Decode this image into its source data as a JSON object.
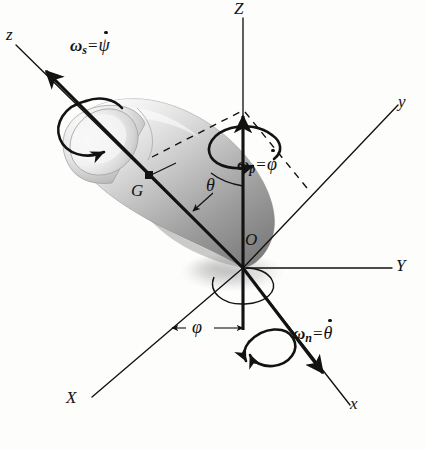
{
  "figure": {
    "background_color": "#fdfdfc",
    "ink_color": "#121212",
    "body_color": "#b8b8b8"
  },
  "axes": [
    {
      "name": "Z-axis",
      "label": "Z",
      "style": "solid",
      "from": [
        243,
        268
      ],
      "to": [
        243,
        18
      ],
      "label_pos": [
        237,
        2
      ],
      "arrow": false
    },
    {
      "name": "y-axis",
      "label": "y",
      "style": "solid",
      "from": [
        243,
        268
      ],
      "to": [
        398,
        105
      ],
      "label_pos": [
        399,
        95
      ],
      "arrow": false
    },
    {
      "name": "Y-axis",
      "label": "Y",
      "style": "solid",
      "from": [
        243,
        268
      ],
      "to": [
        392,
        268
      ],
      "label_pos": [
        396,
        258
      ],
      "arrow": false
    },
    {
      "name": "x-axis",
      "label": "x",
      "style": "solid",
      "from": [
        243,
        268
      ],
      "to": [
        350,
        405
      ],
      "label_pos": [
        352,
        397
      ],
      "arrow": false
    },
    {
      "name": "X-axis",
      "label": "X",
      "style": "solid",
      "from": [
        243,
        268
      ],
      "to": [
        92,
        397
      ],
      "label_pos": [
        69,
        392
      ],
      "arrow": false
    },
    {
      "name": "z-axis-spin",
      "label": "z",
      "style": "solid",
      "from": [
        243,
        268
      ],
      "to": [
        16,
        45
      ],
      "label_pos": [
        8,
        28
      ],
      "arrow": false
    }
  ],
  "vectors": [
    {
      "name": "spin-vector",
      "label_key": "omega_s",
      "from": [
        243,
        268
      ],
      "to": [
        38,
        63
      ],
      "weight": 3.0
    },
    {
      "name": "precession-vector",
      "label_key": "omega_p",
      "from": [
        243,
        330
      ],
      "to": [
        243,
        108
      ],
      "weight": 3.0
    },
    {
      "name": "nutation-vector",
      "label_key": "omega_n",
      "from": [
        243,
        268
      ],
      "to": [
        330,
        382
      ],
      "weight": 3.0
    }
  ],
  "dashed_lines": [
    {
      "name": "dashed-to-apex-left",
      "from": [
        150,
        155
      ],
      "to": [
        243,
        110
      ]
    },
    {
      "name": "dashed-to-apex-right",
      "from": [
        243,
        110
      ],
      "to": [
        305,
        185
      ]
    }
  ],
  "labels": {
    "omega_s": {
      "omega": "ω",
      "sub": "s",
      "eq": "=",
      "rate": "ψ",
      "text": "ωs = ψ̇",
      "pos": [
        72,
        45
      ]
    },
    "omega_p": {
      "omega": "ω",
      "sub": "p",
      "eq": "=",
      "rate": "φ",
      "text": "ωp = φ̇",
      "pos": [
        240,
        163
      ]
    },
    "omega_n": {
      "omega": "ω",
      "sub": "n",
      "eq": "=",
      "rate": "θ",
      "text": "ωn = θ̇",
      "pos": [
        296,
        332
      ]
    },
    "theta": {
      "text": "θ",
      "pos": [
        209,
        186
      ]
    },
    "phi": {
      "text": "φ",
      "pos": [
        197,
        328
      ]
    },
    "point_G": {
      "text": "G",
      "pos": [
        133,
        185
      ],
      "marker": [
        149,
        175
      ]
    },
    "point_O": {
      "text": "O",
      "pos": [
        246,
        234
      ]
    }
  },
  "angles": [
    {
      "name": "nutation-angle-theta",
      "symbol": "θ",
      "between": [
        "Z-axis",
        "z-axis-spin"
      ],
      "vertex": [
        243,
        268
      ]
    },
    {
      "name": "precession-angle-phi",
      "symbol": "φ",
      "between": [
        "X-axis",
        "x-axis"
      ],
      "vertex": [
        243,
        268
      ]
    }
  ],
  "curved_arrows": [
    {
      "name": "spin-rotation-arrow",
      "about": "z-axis-spin",
      "center": [
        88,
        120
      ]
    },
    {
      "name": "precession-rotation-arrow",
      "about": "Z-axis",
      "center": [
        243,
        150
      ]
    },
    {
      "name": "nutation-rotation-arrow",
      "about": "x-axis",
      "center": [
        272,
        343
      ]
    }
  ],
  "body": {
    "name": "spinning-top",
    "description": "shaded top / gyroscope body on the z spin axis with apex at O",
    "center_of_mass": "G"
  }
}
